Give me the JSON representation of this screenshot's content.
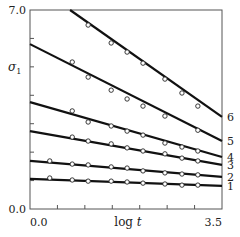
{
  "chart_data": {
    "type": "line",
    "title": "",
    "xlabel": "log t",
    "ylabel": "σ1",
    "xlim": [
      0.0,
      3.5
    ],
    "ylim": [
      0.0,
      7.0
    ],
    "x_tick_labels": [
      "0.0",
      "3.5"
    ],
    "y_tick_labels": [
      "0.0",
      "7.0"
    ],
    "x_ticks": [
      0.0,
      0.5,
      1.0,
      1.5,
      2.0,
      2.5,
      3.0,
      3.5
    ],
    "y_ticks": [
      0,
      1,
      2,
      3,
      4,
      5,
      6,
      7
    ],
    "grid": false,
    "legend": "series numbers labeled at right end of lines",
    "series": [
      {
        "name": "1",
        "line": {
          "x": [
            0.0,
            3.5
          ],
          "y": [
            1.06,
            0.81
          ]
        },
        "points": {
          "x": [
            0.36,
            0.77,
            1.06,
            1.48,
            1.77,
            2.06,
            2.46,
            2.77,
            3.06
          ],
          "y": [
            1.09,
            1.02,
            0.98,
            0.98,
            0.95,
            0.91,
            0.88,
            0.84,
            0.84
          ]
        }
      },
      {
        "name": "2",
        "line": {
          "x": [
            0.0,
            3.5
          ],
          "y": [
            1.69,
            1.13
          ]
        },
        "points": {
          "x": [
            0.36,
            0.77,
            1.06,
            1.48,
            1.77,
            2.06,
            2.46,
            2.77,
            3.06
          ],
          "y": [
            1.69,
            1.58,
            1.55,
            1.48,
            1.44,
            1.34,
            1.27,
            1.23,
            1.2
          ]
        }
      },
      {
        "name": "3",
        "line": {
          "x": [
            0.0,
            3.5
          ],
          "y": [
            2.74,
            1.55
          ]
        },
        "points": {
          "x": [
            0.77,
            1.06,
            1.48,
            1.77,
            2.06,
            2.46,
            2.77,
            3.06
          ],
          "y": [
            2.53,
            2.39,
            2.29,
            2.15,
            2.04,
            1.94,
            1.79,
            1.69
          ]
        }
      },
      {
        "name": "4",
        "line": {
          "x": [
            0.0,
            3.5
          ],
          "y": [
            3.76,
            1.83
          ]
        },
        "points": {
          "x": [
            0.77,
            1.06,
            1.48,
            1.77,
            2.06,
            2.46,
            2.77,
            3.06
          ],
          "y": [
            3.45,
            3.06,
            2.92,
            2.74,
            2.6,
            2.32,
            2.18,
            2.04
          ]
        }
      },
      {
        "name": "5",
        "line": {
          "x": [
            0.0,
            3.5
          ],
          "y": [
            5.8,
            2.39
          ]
        },
        "points": {
          "x": [
            0.77,
            1.06,
            1.48,
            1.77,
            2.06,
            2.46,
            3.06
          ],
          "y": [
            5.17,
            4.64,
            4.18,
            3.87,
            3.62,
            3.27,
            2.77
          ]
        }
      },
      {
        "name": "6",
        "line": {
          "x": [
            0.73,
            3.5
          ],
          "y": [
            7.0,
            3.24
          ]
        },
        "points": {
          "x": [
            1.06,
            1.48,
            1.77,
            2.06,
            2.46,
            2.77,
            3.06
          ],
          "y": [
            6.47,
            5.84,
            5.52,
            5.13,
            4.57,
            4.08,
            3.62
          ]
        }
      }
    ]
  }
}
